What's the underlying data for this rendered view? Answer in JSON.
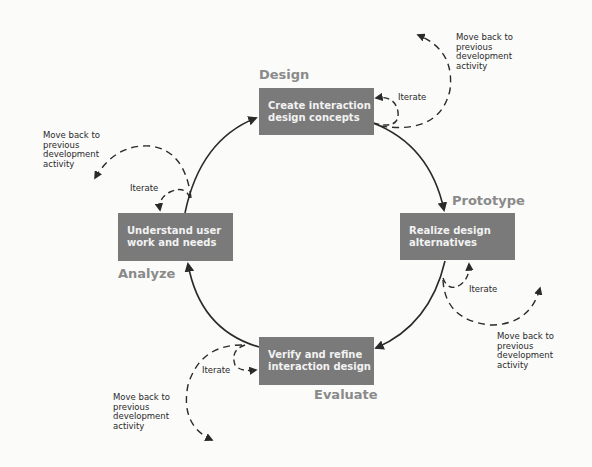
{
  "stages": {
    "design": {
      "phase": "Design",
      "line1": "Create interaction",
      "line2": "design concepts",
      "iterate": "Iterate",
      "move_back": [
        "Move back to",
        "previous",
        "development",
        "activity"
      ]
    },
    "prototype": {
      "phase": "Prototype",
      "line1": "Realize design",
      "line2": "alternatives",
      "iterate": "Iterate",
      "move_back": [
        "Move back to",
        "previous",
        "development",
        "activity"
      ]
    },
    "evaluate": {
      "phase": "Evaluate",
      "line1": "Verify and refine",
      "line2": "interaction design",
      "iterate": "Iterate",
      "move_back": [
        "Move back to",
        "previous",
        "development",
        "activity"
      ]
    },
    "analyze": {
      "phase": "Analyze",
      "line1": "Understand user",
      "line2": "work and needs",
      "iterate": "Iterate",
      "move_back": [
        "Move back to",
        "previous",
        "development",
        "activity"
      ]
    }
  },
  "colors": {
    "box_fill": "#7a7a7a",
    "box_text": "#f2f2f2",
    "phase_label": "#8a8a8a",
    "arrows": "#2a2a2a",
    "background": "#fbfbfa"
  }
}
